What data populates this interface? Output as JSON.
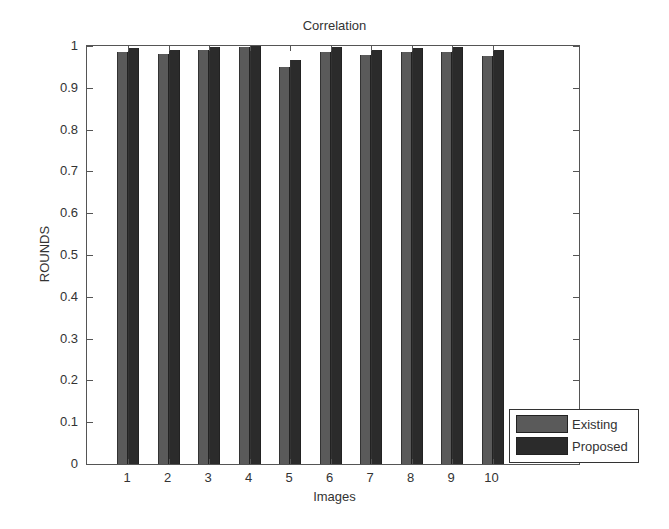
{
  "chart_data": {
    "type": "bar",
    "title": "Correlation",
    "xlabel": "Images",
    "ylabel": "ROUNDS",
    "categories": [
      "1",
      "2",
      "3",
      "4",
      "5",
      "6",
      "7",
      "8",
      "9",
      "10"
    ],
    "series": [
      {
        "name": "Existing",
        "color": "#5a5a5a",
        "values": [
          0.985,
          0.98,
          0.99,
          0.998,
          0.95,
          0.985,
          0.978,
          0.985,
          0.985,
          0.977
        ]
      },
      {
        "name": "Proposed",
        "color": "#2b2b2b",
        "values": [
          0.995,
          0.99,
          0.998,
          0.999,
          0.967,
          0.998,
          0.99,
          0.995,
          0.998,
          0.99
        ]
      }
    ],
    "ylim": [
      0,
      1
    ],
    "yticks": [
      "0",
      "0.1",
      "0.2",
      "0.3",
      "0.4",
      "0.5",
      "0.6",
      "0.7",
      "0.8",
      "0.9",
      "1"
    ],
    "grid": false,
    "legend_position": "lower right (outside axes edge)"
  }
}
